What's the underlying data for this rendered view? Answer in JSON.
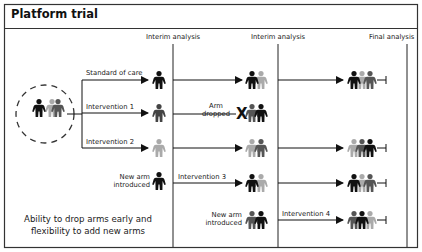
{
  "title": "Platform trial",
  "colors": {
    "black": "#111111",
    "dark_gray": "#555555",
    "light_gray": "#aaaaaa",
    "border": "#333333"
  },
  "analysis_labels": {
    "interim_1": "Interim analysis",
    "interim_2": "Interim analysis",
    "final": "Final analysis"
  },
  "arms": {
    "standard_of_care": "Standard of care",
    "intervention_1": "Intervention 1",
    "intervention_2": "Intervention 2",
    "intervention_3": "Intervention 3",
    "intervention_4": "Intervention 4"
  },
  "events": {
    "arm_dropped_line1": "Arm",
    "arm_dropped_line2": "dropped",
    "drop_mark": "X",
    "new_arm_1_line1": "New arm",
    "new_arm_1_line2": "introduced",
    "new_arm_2_line1": "New arm",
    "new_arm_2_line2": "introduced"
  },
  "caption": {
    "line1": "Ability to drop arms early and",
    "line2": "flexibility to add new arms"
  }
}
